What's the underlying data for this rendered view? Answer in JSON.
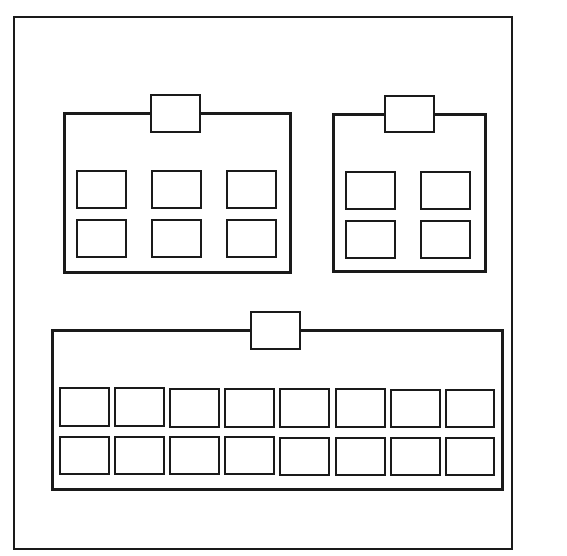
{
  "diagram": {
    "title_partial": " ",
    "frame": {
      "x": 13,
      "y": 16,
      "w": 500,
      "h": 534,
      "color": "#1a1a1a"
    },
    "groups": [
      {
        "name": "top-left-group",
        "box": {
          "x": 63,
          "y": 112,
          "w": 229,
          "h": 162
        },
        "tab": {
          "x": 150,
          "y": 94,
          "w": 51,
          "h": 39
        },
        "rows": 2,
        "cols": 3,
        "cells": [
          {
            "x": 76,
            "y": 170,
            "w": 51,
            "h": 39
          },
          {
            "x": 151,
            "y": 170,
            "w": 51,
            "h": 39
          },
          {
            "x": 226,
            "y": 170,
            "w": 51,
            "h": 39
          },
          {
            "x": 76,
            "y": 219,
            "w": 51,
            "h": 39
          },
          {
            "x": 151,
            "y": 219,
            "w": 51,
            "h": 39
          },
          {
            "x": 226,
            "y": 219,
            "w": 51,
            "h": 39
          }
        ]
      },
      {
        "name": "top-right-group",
        "box": {
          "x": 332,
          "y": 113,
          "w": 155,
          "h": 160
        },
        "tab": {
          "x": 384,
          "y": 95,
          "w": 51,
          "h": 38
        },
        "rows": 2,
        "cols": 2,
        "cells": [
          {
            "x": 345,
            "y": 171,
            "w": 51,
            "h": 39
          },
          {
            "x": 420,
            "y": 171,
            "w": 51,
            "h": 39
          },
          {
            "x": 345,
            "y": 220,
            "w": 51,
            "h": 39
          },
          {
            "x": 420,
            "y": 220,
            "w": 51,
            "h": 39
          }
        ]
      },
      {
        "name": "bottom-group",
        "box": {
          "x": 51,
          "y": 329,
          "w": 453,
          "h": 162
        },
        "tab": {
          "x": 250,
          "y": 311,
          "w": 51,
          "h": 39
        },
        "rows": 2,
        "cols": 8,
        "cells": [
          {
            "x": 59,
            "y": 387,
            "w": 51,
            "h": 40
          },
          {
            "x": 114,
            "y": 387,
            "w": 51,
            "h": 40
          },
          {
            "x": 169,
            "y": 388,
            "w": 51,
            "h": 40
          },
          {
            "x": 224,
            "y": 388,
            "w": 51,
            "h": 40
          },
          {
            "x": 279,
            "y": 388,
            "w": 51,
            "h": 40
          },
          {
            "x": 335,
            "y": 388,
            "w": 51,
            "h": 40
          },
          {
            "x": 390,
            "y": 389,
            "w": 51,
            "h": 39
          },
          {
            "x": 445,
            "y": 389,
            "w": 50,
            "h": 39
          },
          {
            "x": 59,
            "y": 436,
            "w": 51,
            "h": 39
          },
          {
            "x": 114,
            "y": 436,
            "w": 51,
            "h": 39
          },
          {
            "x": 169,
            "y": 436,
            "w": 51,
            "h": 39
          },
          {
            "x": 224,
            "y": 436,
            "w": 51,
            "h": 39
          },
          {
            "x": 279,
            "y": 437,
            "w": 51,
            "h": 39
          },
          {
            "x": 335,
            "y": 437,
            "w": 51,
            "h": 39
          },
          {
            "x": 390,
            "y": 437,
            "w": 51,
            "h": 39
          },
          {
            "x": 445,
            "y": 437,
            "w": 50,
            "h": 39
          }
        ]
      }
    ]
  }
}
